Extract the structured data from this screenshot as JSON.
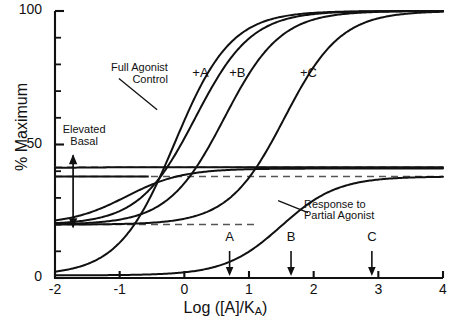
{
  "chart_data": {
    "type": "line",
    "title": "",
    "xlabel": "Log ([A]/KA)",
    "ylabel": "% Maximum",
    "xlim": [
      -2,
      4
    ],
    "ylim": [
      0,
      100
    ],
    "grid": false,
    "legend_position": "inline-curve-labels",
    "x_ticks": [
      "-2",
      "-1",
      "0",
      "1",
      "2",
      "3",
      "4"
    ],
    "x_tick_values": [
      -2,
      -1,
      0,
      1,
      2,
      3,
      4
    ],
    "y_ticks": [
      "0",
      "50",
      "100"
    ],
    "y_tick_values": [
      0,
      50,
      100
    ],
    "y_minor_tick_values": [
      10,
      20,
      30,
      40,
      60,
      70,
      80,
      90
    ],
    "crossover_point": {
      "x": -0.15,
      "y": 41
    },
    "series": [
      {
        "name": "Full Agonist Control",
        "label": "Full Agonist\nControl",
        "ec50_log": -0.15,
        "basal": 1,
        "max": 100,
        "hill": 1.0,
        "points": [
          {
            "x": -2.0,
            "y": 1.3
          },
          {
            "x": -1.5,
            "y": 3.2
          },
          {
            "x": -1.0,
            "y": 8.2
          },
          {
            "x": -0.5,
            "y": 22.0
          },
          {
            "x": -0.15,
            "y": 41.0
          },
          {
            "x": 0.0,
            "y": 50.5
          },
          {
            "x": 0.5,
            "y": 76.0
          },
          {
            "x": 1.0,
            "y": 91.0
          },
          {
            "x": 1.5,
            "y": 96.8
          },
          {
            "x": 2.0,
            "y": 98.9
          },
          {
            "x": 3.0,
            "y": 99.8
          },
          {
            "x": 4.0,
            "y": 100.0
          }
        ]
      },
      {
        "name": "Full Agonist plus A",
        "label": "+A",
        "ec50_log": 0.17,
        "basal": 20,
        "max": 100,
        "hill": 1.0,
        "points": [
          {
            "x": -2.0,
            "y": 20.2
          },
          {
            "x": -1.5,
            "y": 20.7
          },
          {
            "x": -1.0,
            "y": 22.0
          },
          {
            "x": -0.5,
            "y": 25.7
          },
          {
            "x": -0.15,
            "y": 41.0
          },
          {
            "x": 0.0,
            "y": 44.0
          },
          {
            "x": 0.5,
            "y": 64.0
          },
          {
            "x": 1.0,
            "y": 84.0
          },
          {
            "x": 1.5,
            "y": 93.5
          },
          {
            "x": 2.0,
            "y": 97.4
          },
          {
            "x": 3.0,
            "y": 99.6
          },
          {
            "x": 4.0,
            "y": 100.0
          }
        ]
      },
      {
        "name": "Full Agonist plus B",
        "label": "+B",
        "ec50_log": 0.62,
        "basal": 20,
        "max": 100,
        "hill": 1.0,
        "points": [
          {
            "x": -2.0,
            "y": 20.0
          },
          {
            "x": -1.0,
            "y": 20.6
          },
          {
            "x": -0.5,
            "y": 22.0
          },
          {
            "x": -0.15,
            "y": 41.0
          },
          {
            "x": 0.0,
            "y": 36.0
          },
          {
            "x": 0.5,
            "y": 53.0
          },
          {
            "x": 1.0,
            "y": 73.0
          },
          {
            "x": 1.5,
            "y": 87.5
          },
          {
            "x": 2.0,
            "y": 95.0
          },
          {
            "x": 2.5,
            "y": 98.0
          },
          {
            "x": 3.0,
            "y": 99.3
          },
          {
            "x": 4.0,
            "y": 100.0
          }
        ]
      },
      {
        "name": "Full Agonist plus C",
        "label": "+C",
        "ec50_log": 1.55,
        "basal": 20,
        "max": 100,
        "hill": 1.0,
        "points": [
          {
            "x": -2.0,
            "y": 19.8
          },
          {
            "x": -0.15,
            "y": 41.0
          },
          {
            "x": 0.0,
            "y": 21.5
          },
          {
            "x": 0.5,
            "y": 26.0
          },
          {
            "x": 1.0,
            "y": 38.0
          },
          {
            "x": 1.5,
            "y": 57.0
          },
          {
            "x": 2.0,
            "y": 76.0
          },
          {
            "x": 2.5,
            "y": 89.0
          },
          {
            "x": 3.0,
            "y": 95.5
          },
          {
            "x": 3.5,
            "y": 98.3
          },
          {
            "x": 4.0,
            "y": 99.4
          }
        ]
      },
      {
        "name": "Response to Partial Agonist",
        "label": "Response to\nPartial Agonist",
        "ec50_log": 1.5,
        "basal": 1,
        "max": 38,
        "hill": 1.0,
        "points": [
          {
            "x": -2.0,
            "y": 1.0
          },
          {
            "x": -1.5,
            "y": 1.6
          },
          {
            "x": -1.0,
            "y": 3.0
          },
          {
            "x": -0.5,
            "y": 5.2
          },
          {
            "x": 0.0,
            "y": 8.5
          },
          {
            "x": 0.5,
            "y": 14.0
          },
          {
            "x": 1.0,
            "y": 21.5
          },
          {
            "x": 1.5,
            "y": 29.0
          },
          {
            "x": 2.0,
            "y": 34.0
          },
          {
            "x": 2.5,
            "y": 36.5
          },
          {
            "x": 3.0,
            "y": 37.5
          },
          {
            "x": 4.0,
            "y": 38.0
          }
        ]
      },
      {
        "name": "Elevated Basal Plateau",
        "label": "",
        "ec50_log": -0.9,
        "basal": 20,
        "max": 41,
        "hill": 1.0,
        "points": [
          {
            "x": -2.0,
            "y": 20.5
          },
          {
            "x": -1.5,
            "y": 22.5
          },
          {
            "x": -1.0,
            "y": 27.5
          },
          {
            "x": -0.5,
            "y": 34.5
          },
          {
            "x": -0.15,
            "y": 39.0
          },
          {
            "x": 0.0,
            "y": 40.0
          },
          {
            "x": 0.5,
            "y": 41.0
          },
          {
            "x": 1.0,
            "y": 41.3
          },
          {
            "x": 2.0,
            "y": 41.4
          },
          {
            "x": 4.0,
            "y": 41.5
          }
        ]
      },
      {
        "name": "Upper Basal Plateau",
        "label": "",
        "ec50_log": -2.0,
        "basal": 41,
        "max": 41.5,
        "hill": 1.0,
        "points": [
          {
            "x": -2.0,
            "y": 41.3
          },
          {
            "x": 0.0,
            "y": 41.4
          },
          {
            "x": 2.0,
            "y": 41.5
          },
          {
            "x": 4.0,
            "y": 41.5
          }
        ]
      }
    ],
    "reference_lines": [
      {
        "name": "upper-basal-dashed",
        "y": 41.5,
        "x_from": -2.0,
        "x_to": 4.0,
        "style": "dashed"
      },
      {
        "name": "partial-agonist-max-dashed",
        "y": 38.0,
        "x_from": -2.0,
        "x_to": 4.0,
        "style": "dashed"
      },
      {
        "name": "lower-basal-dashed",
        "y": 20.0,
        "x_from": -2.0,
        "x_to": 1.1,
        "style": "dashed"
      },
      {
        "name": "partial-agonist-max-solid",
        "y": 38.0,
        "x_from": -2.0,
        "x_to": -0.55,
        "style": "solid"
      }
    ],
    "annotations": [
      {
        "name": "elevated-basal",
        "text": "Elevated\nBasal",
        "x": -1.55,
        "y": 54,
        "arrow": {
          "type": "double-headed-vertical",
          "x": -1.72,
          "y_from": 19,
          "y_to": 46
        }
      },
      {
        "name": "full-agonist-control",
        "text": "Full Agonist\nControl",
        "x": -0.95,
        "y": 77,
        "leader_to": {
          "x": -0.42,
          "y": 63
        }
      },
      {
        "name": "response-to-partial-agonist",
        "text": "Response to\nPartial Agonist",
        "x": 1.85,
        "y": 26,
        "leader_to": {
          "x": 1.45,
          "y": 29
        }
      },
      {
        "name": "curve-label-a",
        "text": "+A",
        "x": 0.25,
        "y": 76
      },
      {
        "name": "curve-label-b",
        "text": "+B",
        "x": 0.82,
        "y": 76
      },
      {
        "name": "curve-label-c",
        "text": "+C",
        "x": 1.92,
        "y": 76
      }
    ],
    "axis_markers": [
      {
        "name": "marker-a",
        "label": "A",
        "x": 0.7
      },
      {
        "name": "marker-b",
        "label": "B",
        "x": 1.65
      },
      {
        "name": "marker-c",
        "label": "C",
        "x": 2.9
      }
    ]
  },
  "axes": {
    "y_title": "% Maximum",
    "x_title_main": "Log ([A]/K",
    "x_title_sub": "A",
    "x_title_close": ")"
  },
  "style": {
    "curve_color": "#111111",
    "dashed_color": "#555555",
    "axis_color": "#111111",
    "background": "#ffffff"
  }
}
